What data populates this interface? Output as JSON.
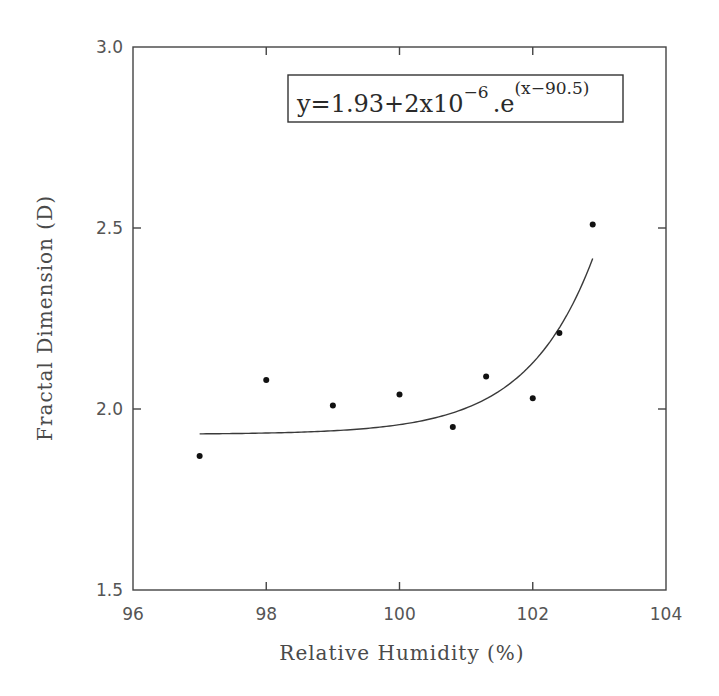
{
  "chart_data": {
    "type": "scatter",
    "title": "",
    "xlabel": "Relative Humidity (%)",
    "ylabel": "Fractal Dimension (D)",
    "xlim": [
      96,
      104
    ],
    "ylim": [
      1.5,
      3.0
    ],
    "x_ticks": [
      96,
      98,
      100,
      102,
      104
    ],
    "x_tick_labels": [
      "96",
      "98",
      "100",
      "102",
      "104"
    ],
    "y_ticks": [
      1.5,
      2.0,
      2.5,
      3.0
    ],
    "y_tick_labels": [
      "1.5",
      "2.0",
      "2.5",
      "3.0"
    ],
    "grid": false,
    "series": [
      {
        "name": "Measured",
        "type": "scatter",
        "marker": "filled-circle",
        "color": "#111111",
        "x": [
          97.0,
          98.0,
          99.0,
          100.0,
          100.8,
          101.3,
          102.0,
          102.4,
          102.9
        ],
        "y": [
          1.87,
          2.08,
          2.01,
          2.04,
          1.95,
          2.09,
          2.03,
          2.21,
          2.51
        ]
      },
      {
        "name": "Fit",
        "type": "line",
        "color": "#3a3a3a",
        "equation": "y = 1.93 + 2e-6 * exp(x - 90.5)",
        "x_range": [
          97.0,
          102.9
        ]
      }
    ],
    "annotations": [
      {
        "type": "equation-box",
        "text": "y=1.93+2x10^-6.e^(x-90.5)",
        "position": "top-right"
      }
    ],
    "legend": null
  },
  "equation": {
    "main": "y=1.93+2x10",
    "exp1": "−6",
    "mid": ".e",
    "exp2": "(x−90.5)"
  },
  "axes": {
    "xlabel": "Relative Humidity (%)",
    "ylabel": "Fractal Dimension (D)",
    "x_tick_labels": [
      "96",
      "98",
      "100",
      "102",
      "104"
    ],
    "y_tick_labels": [
      "1.5",
      "2.0",
      "2.5",
      "3.0"
    ]
  },
  "fit": {
    "a": 1.93,
    "b": 2e-06,
    "c": 90.5,
    "x_start": 97.0,
    "x_end": 102.9
  }
}
